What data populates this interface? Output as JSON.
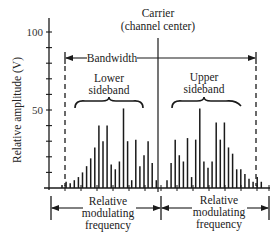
{
  "figure": {
    "carrier_label_line1": "Carrier",
    "carrier_label_line2": "(channel center)",
    "bandwidth_label": "Bandwidth",
    "lower_sideband_line1": "Lower",
    "lower_sideband_line2": "sideband",
    "upper_sideband_line1": "Upper",
    "upper_sideband_line2": "sideband",
    "y_axis_label": "Relative amplitude (V)",
    "y_tick_100": "100",
    "y_tick_50": "50",
    "bottom_left_line1": "Relative",
    "bottom_left_line2": "modulating",
    "bottom_left_line3": "frequency",
    "bottom_right_line1": "Relative",
    "bottom_right_line2": "modulating",
    "bottom_right_line3": "frequency"
  },
  "chart_data": {
    "type": "bar",
    "title": "",
    "xlabel": "Relative modulating frequency",
    "ylabel": "Relative amplitude (V)",
    "ylim": [
      0,
      100
    ],
    "y_ticks": [
      0,
      10,
      20,
      30,
      40,
      50,
      60,
      70,
      80,
      90,
      100
    ],
    "y_tick_labels": [
      "50",
      "100"
    ],
    "carrier": {
      "label": "Carrier (channel center)",
      "amplitude": 100
    },
    "series": [
      {
        "name": "Lower sideband",
        "values": [
          2,
          4,
          3,
          5,
          7,
          10,
          14,
          19,
          26,
          40,
          30,
          40,
          15,
          12,
          17,
          51,
          30,
          5,
          31,
          14,
          21,
          30,
          16,
          5
        ]
      },
      {
        "name": "Upper sideband",
        "values": [
          5,
          16,
          31,
          21,
          17,
          32,
          7,
          31,
          51,
          17,
          13,
          17,
          42,
          31,
          42,
          26,
          22,
          12,
          12,
          9,
          6,
          4,
          7,
          4
        ]
      }
    ],
    "annotations": [
      "Bandwidth",
      "Lower sideband",
      "Upper sideband",
      "Relative modulating frequency",
      "Relative modulating frequency"
    ],
    "grid": false
  }
}
